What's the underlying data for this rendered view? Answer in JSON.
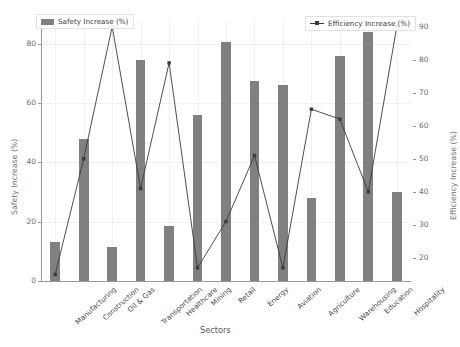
{
  "chart_data": {
    "type": "bar",
    "title": "",
    "xlabel": "Sectors",
    "ylabel": "Safety Increase (%)",
    "ylabel_right": "Efficiency Increase (%)",
    "categories": [
      "Manufacturing",
      "Construction",
      "Oil & Gas",
      "Transportation",
      "Healthcare",
      "Mining",
      "Retail",
      "Energy",
      "Aviation",
      "Agriculture",
      "Warehousing",
      "Education",
      "Hospitality"
    ],
    "ylim": [
      0,
      88
    ],
    "ylim_right": [
      13,
      92
    ],
    "yticks": [
      0,
      20,
      40,
      60,
      80
    ],
    "yticks_right": [
      20,
      30,
      40,
      50,
      60,
      70,
      80,
      90
    ],
    "grid": true,
    "legend_position": "top-left and top-right",
    "series": [
      {
        "name": "Safety Increase (%)",
        "type": "bar",
        "axis": "left",
        "color": "#808080",
        "values": [
          13,
          48,
          11.5,
          74.5,
          18.5,
          56,
          80.5,
          67.5,
          66,
          28,
          76,
          84,
          30
        ]
      },
      {
        "name": "Efficiency Increase (%)",
        "type": "line",
        "axis": "right",
        "color": "#3a3a3a",
        "values": [
          15,
          50,
          90,
          41,
          79,
          17,
          31,
          51,
          17,
          65,
          62,
          40,
          90
        ]
      }
    ]
  },
  "legend": {
    "safety_label": "Safety Increase (%)",
    "efficiency_label": "Efficiency Increase (%)"
  },
  "axes": {
    "x_title": "Sectors",
    "y_left_title": "Safety Increase (%)",
    "y_right_title": "Efficiency Increase (%)"
  }
}
